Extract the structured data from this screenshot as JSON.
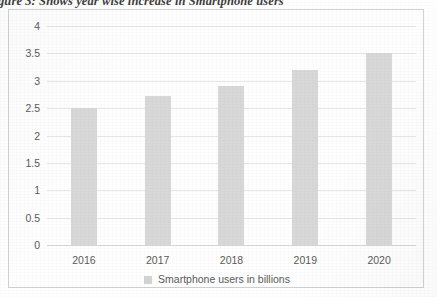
{
  "figure": {
    "caption": "Figure 3: Shows year wise increase in Smartphone users"
  },
  "legend": {
    "label": "Smartphone users in billions",
    "swatch_name": "legend-color-swatch",
    "swatch_color": "#d3d3d3",
    "position": "bottom-center"
  },
  "colors": {
    "bar": "#d8d8d8",
    "gridline": "#e6e6e6",
    "axis": "#d8d8d8",
    "frame_border": "#d2d2d2",
    "text": "#5b5b5b",
    "background": "#ffffff"
  },
  "chart_data": {
    "type": "bar",
    "title": "",
    "subtitle": "",
    "categories": [
      "2016",
      "2017",
      "2018",
      "2019",
      "2020"
    ],
    "values": [
      2.5,
      2.72,
      2.9,
      3.2,
      3.5
    ],
    "series": [
      {
        "name": "Smartphone users in billions",
        "values": [
          2.5,
          2.72,
          2.9,
          3.2,
          3.5
        ]
      }
    ],
    "xlabel": "",
    "ylabel": "",
    "ylim": [
      0,
      4
    ],
    "ytick_values": [
      0,
      0.5,
      1,
      1.5,
      2,
      2.5,
      3,
      3.5,
      4
    ],
    "ytick_labels": [
      "0",
      "0.5",
      "1",
      "1.5",
      "2",
      "2.5",
      "3",
      "3.5",
      "4"
    ],
    "xtick_labels": [
      "2016",
      "2017",
      "2018",
      "2019",
      "2020"
    ],
    "grid": true,
    "grid_axis": "y",
    "legend_position": "bottom"
  }
}
